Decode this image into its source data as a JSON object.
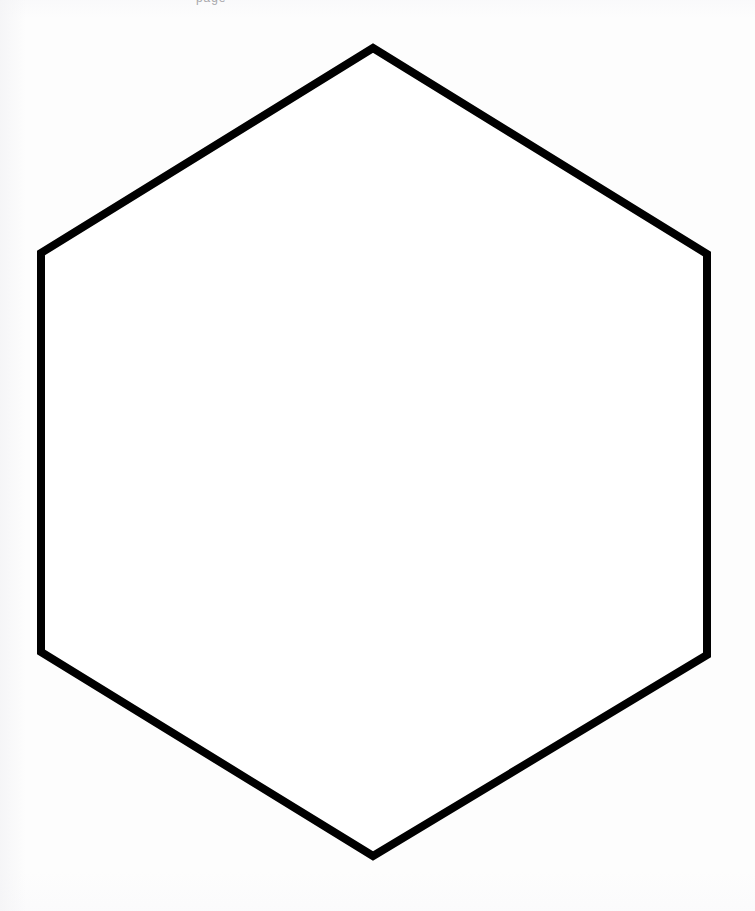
{
  "page": {
    "width": 755,
    "height": 911,
    "background_color": "#fdfdfd",
    "paper_tint": "#f6f6f8"
  },
  "header": {
    "clipped_text": "page",
    "note": "text clipped by top edge of page"
  },
  "figure": {
    "name": "hexagon",
    "shape_type": "regular hexagon",
    "orientation": "pointy-top",
    "stroke_color": "#000000",
    "fill_color": "#ffffff",
    "stroke_width": 8,
    "center_x": 374,
    "center_y": 452,
    "vertices": [
      {
        "label": "top",
        "x": 373,
        "y": 48
      },
      {
        "label": "upper-right",
        "x": 707,
        "y": 254
      },
      {
        "label": "lower-right",
        "x": 707,
        "y": 655
      },
      {
        "label": "bottom",
        "x": 373,
        "y": 856
      },
      {
        "label": "lower-left",
        "x": 41,
        "y": 652
      },
      {
        "label": "upper-left",
        "x": 41,
        "y": 253
      }
    ],
    "points_attr": "373,48 707,254 707,655 373,856 41,652 41,253"
  }
}
